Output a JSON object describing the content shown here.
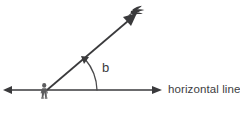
{
  "diagram": {
    "canvas": {
      "width": 240,
      "height": 119,
      "background": "#ffffff"
    },
    "colors": {
      "line": "#3a3a3c",
      "arc": "#4a4a4c",
      "figure": "#5c5c5e",
      "text": "#3f3f41"
    },
    "labels": {
      "horizontal_line": "horizontal line",
      "angle": "b"
    },
    "icons": {
      "observer": "person-icon",
      "target": "bird-icon"
    },
    "geometry": {
      "vertex": {
        "x": 47,
        "y": 90
      },
      "horizontal_left_end": {
        "x": 4,
        "y": 90
      },
      "horizontal_right_end": {
        "x": 161,
        "y": 90
      },
      "sight_ray_end": {
        "x": 137,
        "y": 13
      },
      "arc_radius": 50,
      "angle_degrees": 30
    },
    "watermark": {
      "text": ""
    }
  }
}
